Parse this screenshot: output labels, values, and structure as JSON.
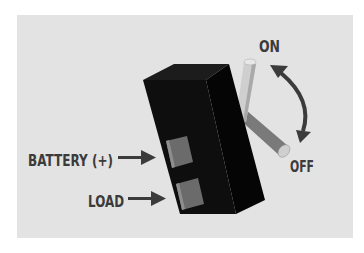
{
  "diagram": {
    "type": "toggle-switch-wiring",
    "labels": {
      "on": "ON",
      "off": "OFF",
      "battery": "BATTERY (+)",
      "load": "LOAD"
    },
    "colors": {
      "background": "#e3e3e3",
      "switch_body": "#0e0e0e",
      "terminal": "#6b6b6b",
      "lever_on": "#d0d0d0",
      "lever_off": "#7a7a7a",
      "text": "#3b3b3b",
      "arrow": "#3b3b3b"
    },
    "components": [
      {
        "name": "switch-body",
        "description": "black rectangular switch housing"
      },
      {
        "name": "battery-terminal",
        "label": "BATTERY (+)"
      },
      {
        "name": "load-terminal",
        "label": "LOAD"
      },
      {
        "name": "toggle-lever",
        "positions": [
          "ON",
          "OFF"
        ]
      }
    ]
  }
}
